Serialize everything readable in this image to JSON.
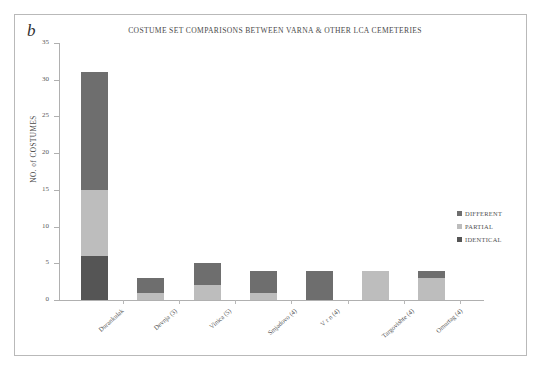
{
  "figure": {
    "panel_letter": "b",
    "title": "COSTUME SET COMPARISONS BETWEEN VARNA & OTHER LCA CEMETERIES"
  },
  "colors": {
    "different": "#6e6e6e",
    "partial": "#bdbdbd",
    "identical": "#555555",
    "axis": "#b0b0b0",
    "text": "#4a4a4a",
    "frame": "#b9b9b9"
  },
  "legend": {
    "position": "right-middle",
    "items": [
      {
        "label": "DIFFERENT",
        "color": "#6e6e6e"
      },
      {
        "label": "PARTIAL",
        "color": "#bdbdbd"
      },
      {
        "label": "IDENTICAL",
        "color": "#555555"
      }
    ]
  },
  "chart_data": {
    "type": "bar",
    "subtype": "stacked",
    "title": "COSTUME SET COMPARISONS BETWEEN VARNA & OTHER LCA CEMETERIES",
    "xlabel": "",
    "ylabel": "NO. of COSTUMES",
    "ylim": [
      0,
      35
    ],
    "yticks": [
      0,
      5,
      10,
      15,
      20,
      25,
      30,
      35
    ],
    "ytick_labels": [
      "0",
      "5",
      "10",
      "15",
      "20",
      "25",
      "30",
      "35"
    ],
    "grid": false,
    "legend_position": "right",
    "categories": [
      "Durankulak",
      "Devnja (3)",
      "Vinica (5)",
      "Smjadovo (4)",
      "V r  n (4)",
      "Targovishte (4)",
      "Omurtag (4)"
    ],
    "series": [
      {
        "name": "IDENTICAL",
        "color": "#555555",
        "values": [
          6,
          0,
          0,
          0,
          0,
          0,
          0
        ]
      },
      {
        "name": "PARTIAL",
        "color": "#bdbdbd",
        "values": [
          9,
          1,
          2,
          1,
          0,
          4,
          3
        ]
      },
      {
        "name": "DIFFERENT",
        "color": "#6e6e6e",
        "values": [
          16,
          2,
          3,
          3,
          4,
          0,
          1
        ]
      }
    ],
    "totals": [
      31,
      3,
      5,
      4,
      4,
      4,
      4
    ]
  }
}
